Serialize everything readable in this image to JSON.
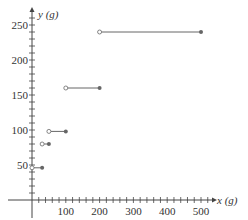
{
  "chart_data": {
    "type": "step",
    "title": "",
    "xlabel": "x (g)",
    "ylabel": "y (g)",
    "x_ticks": [
      100,
      200,
      300,
      400,
      500
    ],
    "y_ticks": [
      50,
      100,
      150,
      200,
      250
    ],
    "x_minor_step": 20,
    "y_minor_step": 10,
    "xlim": [
      0,
      540
    ],
    "ylim": [
      0,
      270
    ],
    "grid": false,
    "segments": [
      {
        "x_start": 0,
        "x_end": 30,
        "y": 46,
        "start_open": true,
        "end_closed": true
      },
      {
        "x_start": 30,
        "x_end": 50,
        "y": 80,
        "start_open": true,
        "end_closed": true
      },
      {
        "x_start": 50,
        "x_end": 100,
        "y": 98,
        "start_open": true,
        "end_closed": true
      },
      {
        "x_start": 100,
        "x_end": 200,
        "y": 160,
        "start_open": true,
        "end_closed": true
      },
      {
        "x_start": 200,
        "x_end": 500,
        "y": 240,
        "start_open": true,
        "end_closed": true
      }
    ]
  },
  "labels": {
    "x_axis": "x (g)",
    "y_axis": "y (g)"
  }
}
